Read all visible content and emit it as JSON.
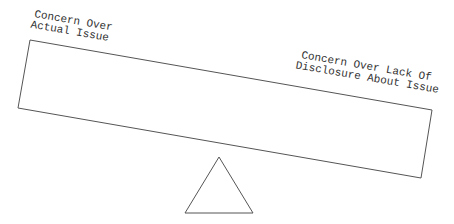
{
  "diagram": {
    "type": "seesaw-balance",
    "left_label": [
      "Concern Over",
      "Actual Issue"
    ],
    "right_label": [
      "Concern Over Lack Of",
      "Disclosure About Issue"
    ],
    "tilt": "right side lower",
    "colors": {
      "stroke": "#555555",
      "text": "#333333",
      "background": "#ffffff"
    }
  }
}
